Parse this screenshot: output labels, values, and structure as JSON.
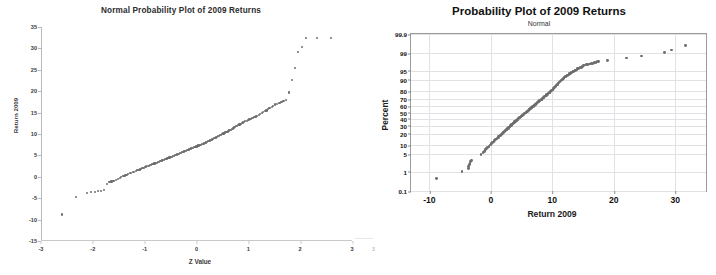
{
  "document": {
    "page_artifact": "3"
  },
  "charts": [
    {
      "id": "normal-probability-plot",
      "title": "Normal Probability Plot of 2009 Returns",
      "subtitle": "",
      "xlabel": "Z Value",
      "ylabel": "Return 2009",
      "marker_color": "#6e6e6e"
    },
    {
      "id": "minitab-probability-plot",
      "title": "Probability Plot of 2009 Returns",
      "subtitle": "Normal",
      "xlabel": "Return 2009",
      "ylabel": "Percent",
      "marker_color": "#6e6e6e"
    }
  ],
  "chart_data": [
    {
      "type": "scatter",
      "title": "Normal Probability Plot of 2009 Returns",
      "subtitle": "",
      "xlabel": "Z Value",
      "ylabel": "Return 2009",
      "xlim": [
        -3,
        3
      ],
      "ylim": [
        -15,
        35
      ],
      "xticks": [
        -3,
        -2,
        -1,
        0,
        1,
        2,
        3
      ],
      "xticklabels": [
        "-3",
        "-2",
        "-1",
        "0",
        "1",
        "2",
        "3"
      ],
      "yticks": [
        -15,
        -10,
        -5,
        0,
        5,
        10,
        15,
        20,
        25,
        30,
        35
      ],
      "yticklabels": [
        "-15",
        "-10",
        "-5",
        "0",
        "5",
        "10",
        "15",
        "20",
        "25",
        "30",
        "35"
      ],
      "grid": false,
      "legend": "none",
      "series": [
        {
          "name": "2009 Returns vs Z",
          "x": [
            -2.6,
            -2.32,
            -2.12,
            -2.04,
            -1.96,
            -1.9,
            -1.84,
            -1.78,
            -1.73,
            -1.68,
            -1.64,
            -1.6,
            -1.56,
            -1.52,
            -1.48,
            -1.45,
            -1.41,
            -1.38,
            -1.35,
            -1.32,
            -1.29,
            -1.26,
            -1.23,
            -1.2,
            -1.17,
            -1.15,
            -1.12,
            -1.09,
            -1.07,
            -1.04,
            -1.02,
            -0.99,
            -0.97,
            -0.94,
            -0.92,
            -0.9,
            -0.87,
            -0.85,
            -0.83,
            -0.81,
            -0.78,
            -0.76,
            -0.74,
            -0.72,
            -0.7,
            -0.68,
            -0.66,
            -0.64,
            -0.62,
            -0.6,
            -0.58,
            -0.56,
            -0.54,
            -0.52,
            -0.5,
            -0.48,
            -0.46,
            -0.44,
            -0.42,
            -0.4,
            -0.38,
            -0.36,
            -0.34,
            -0.32,
            -0.3,
            -0.28,
            -0.26,
            -0.24,
            -0.22,
            -0.2,
            -0.18,
            -0.16,
            -0.14,
            -0.12,
            -0.1,
            -0.08,
            -0.06,
            -0.04,
            -0.02,
            0.0,
            0.02,
            0.04,
            0.06,
            0.08,
            0.1,
            0.12,
            0.14,
            0.16,
            0.18,
            0.2,
            0.22,
            0.24,
            0.26,
            0.28,
            0.3,
            0.32,
            0.34,
            0.36,
            0.38,
            0.4,
            0.42,
            0.44,
            0.46,
            0.48,
            0.5,
            0.52,
            0.54,
            0.56,
            0.58,
            0.6,
            0.62,
            0.64,
            0.66,
            0.68,
            0.7,
            0.72,
            0.74,
            0.76,
            0.78,
            0.81,
            0.83,
            0.85,
            0.87,
            0.9,
            0.92,
            0.94,
            0.97,
            0.99,
            1.02,
            1.04,
            1.07,
            1.09,
            1.12,
            1.15,
            1.17,
            1.2,
            1.23,
            1.26,
            1.29,
            1.32,
            1.35,
            1.38,
            1.41,
            1.45,
            1.48,
            1.52,
            1.56,
            1.6,
            1.64,
            1.68,
            1.73,
            1.78,
            1.84,
            1.9,
            1.96,
            2.04,
            2.12,
            2.32,
            2.6
          ],
          "y": [
            -8.8,
            -4.7,
            -3.7,
            -3.6,
            -3.5,
            -3.4,
            -3.3,
            -3.1,
            -1.6,
            -1.3,
            -1.1,
            -0.9,
            -0.7,
            -0.5,
            -0.3,
            -0.1,
            0.1,
            0.3,
            0.5,
            0.6,
            0.8,
            0.9,
            1.1,
            1.2,
            1.3,
            1.5,
            1.6,
            1.7,
            1.9,
            2.0,
            2.1,
            2.2,
            2.4,
            2.5,
            2.6,
            2.7,
            2.8,
            2.9,
            3.0,
            3.1,
            3.2,
            3.3,
            3.4,
            3.5,
            3.6,
            3.7,
            3.8,
            3.9,
            4.0,
            4.1,
            4.2,
            4.3,
            4.4,
            4.5,
            4.6,
            4.7,
            4.8,
            4.9,
            5.0,
            5.1,
            5.2,
            5.3,
            5.4,
            5.5,
            5.6,
            5.7,
            5.8,
            5.9,
            6.0,
            6.1,
            6.2,
            6.3,
            6.4,
            6.5,
            6.6,
            6.7,
            6.8,
            6.9,
            7.0,
            7.1,
            7.2,
            7.3,
            7.4,
            7.5,
            7.6,
            7.7,
            7.8,
            7.9,
            8.0,
            8.2,
            8.3,
            8.4,
            8.5,
            8.6,
            8.7,
            8.9,
            9.0,
            9.1,
            9.2,
            9.3,
            9.5,
            9.6,
            9.7,
            9.8,
            10.0,
            10.1,
            10.2,
            10.4,
            10.5,
            10.6,
            10.8,
            10.9,
            11.0,
            11.2,
            11.3,
            11.5,
            11.6,
            11.8,
            11.9,
            12.1,
            12.2,
            12.4,
            12.5,
            12.7,
            12.8,
            13.0,
            13.1,
            13.3,
            13.4,
            13.5,
            13.7,
            13.8,
            14.0,
            14.1,
            14.3,
            14.5,
            14.7,
            14.9,
            15.1,
            15.3,
            15.5,
            15.8,
            16.0,
            16.4,
            16.6,
            16.9,
            17.1,
            17.3,
            17.5,
            17.7,
            17.9,
            19.7,
            22.7,
            25.4,
            29.1,
            30.3,
            32.4,
            32.4,
            32.4
          ]
        }
      ]
    },
    {
      "type": "scatter",
      "title": "Probability Plot of 2009 Returns",
      "subtitle": "Normal",
      "xlabel": "Return 2009",
      "ylabel": "Percent",
      "xlim": [
        -13,
        35
      ],
      "ylim_percent": [
        0.1,
        99.9
      ],
      "yscale": "normal-probability",
      "xticks": [
        -10,
        0,
        10,
        20,
        30
      ],
      "xticklabels": [
        "-10",
        "0",
        "10",
        "20",
        "30"
      ],
      "yticks": [
        0.1,
        1,
        5,
        10,
        20,
        30,
        40,
        50,
        60,
        70,
        80,
        90,
        95,
        99,
        99.9
      ],
      "yticklabels": [
        "0.1",
        "1",
        "5",
        "10",
        "20",
        "30",
        "40",
        "50",
        "60",
        "70",
        "80",
        "90",
        "95",
        "99",
        "99.9"
      ],
      "grid": true,
      "legend": "none",
      "series": [
        {
          "name": "2009 Returns percent plot",
          "x": [
            -8.8,
            -4.7,
            -3.7,
            -3.6,
            -3.5,
            -3.4,
            -3.3,
            -3.1,
            -1.6,
            -1.3,
            -1.1,
            -0.9,
            -0.7,
            -0.5,
            -0.3,
            -0.1,
            0.1,
            0.3,
            0.5,
            0.6,
            0.8,
            0.9,
            1.1,
            1.2,
            1.3,
            1.5,
            1.6,
            1.7,
            1.9,
            2.0,
            2.1,
            2.2,
            2.4,
            2.5,
            2.6,
            2.7,
            2.8,
            2.9,
            3.0,
            3.1,
            3.2,
            3.3,
            3.4,
            3.5,
            3.6,
            3.7,
            3.8,
            3.9,
            4.0,
            4.1,
            4.2,
            4.3,
            4.4,
            4.5,
            4.6,
            4.7,
            4.8,
            4.9,
            5.0,
            5.1,
            5.2,
            5.3,
            5.4,
            5.5,
            5.6,
            5.7,
            5.8,
            5.9,
            6.0,
            6.1,
            6.2,
            6.3,
            6.4,
            6.5,
            6.6,
            6.7,
            6.8,
            6.9,
            7.0,
            7.1,
            7.2,
            7.3,
            7.4,
            7.5,
            7.6,
            7.7,
            7.8,
            7.9,
            8.0,
            8.2,
            8.3,
            8.4,
            8.5,
            8.6,
            8.7,
            8.9,
            9.0,
            9.1,
            9.2,
            9.3,
            9.5,
            9.6,
            9.7,
            9.8,
            10.0,
            10.1,
            10.2,
            10.4,
            10.5,
            10.6,
            10.8,
            10.9,
            11.0,
            11.2,
            11.3,
            11.5,
            11.6,
            11.8,
            11.9,
            12.1,
            12.2,
            12.4,
            12.5,
            12.7,
            12.8,
            13.0,
            13.1,
            13.3,
            13.4,
            13.5,
            13.7,
            13.8,
            14.0,
            14.1,
            14.3,
            14.5,
            14.7,
            14.9,
            15.1,
            15.3,
            15.5,
            15.8,
            16.0,
            16.4,
            16.6,
            16.9,
            17.1,
            17.3,
            17.5,
            19.0,
            22.0,
            24.5,
            28.2,
            29.4,
            31.6
          ],
          "percent": [
            0.45,
            1.0,
            1.4,
            1.7,
            2.0,
            2.3,
            2.6,
            2.9,
            5.0,
            5.7,
            6.4,
            7.1,
            7.8,
            8.5,
            9.3,
            10.1,
            10.9,
            11.7,
            12.5,
            13.3,
            14.1,
            14.9,
            15.7,
            16.5,
            17.3,
            18.1,
            18.9,
            19.7,
            20.5,
            21.3,
            22.1,
            22.9,
            23.7,
            24.5,
            25.3,
            26.1,
            26.9,
            27.7,
            28.5,
            29.3,
            30.1,
            30.9,
            31.7,
            32.5,
            33.3,
            34.1,
            34.9,
            35.7,
            36.5,
            37.3,
            38.1,
            38.9,
            39.7,
            40.5,
            41.3,
            42.1,
            42.9,
            43.7,
            44.5,
            45.3,
            46.1,
            46.9,
            47.7,
            48.5,
            49.3,
            50.1,
            50.9,
            51.7,
            52.5,
            53.3,
            54.1,
            54.9,
            55.7,
            56.5,
            57.3,
            58.1,
            58.9,
            59.7,
            60.5,
            61.3,
            62.1,
            62.9,
            63.7,
            64.5,
            65.3,
            66.1,
            66.9,
            67.7,
            68.5,
            69.3,
            70.1,
            70.9,
            71.7,
            72.5,
            73.3,
            74.1,
            74.9,
            75.7,
            76.5,
            77.3,
            78.1,
            78.9,
            79.7,
            80.5,
            81.3,
            82.1,
            82.9,
            83.7,
            84.5,
            85.3,
            86.1,
            86.9,
            87.7,
            88.5,
            89.3,
            89.9,
            90.4,
            90.9,
            91.4,
            91.9,
            92.3,
            92.7,
            93.0,
            93.3,
            93.6,
            93.9,
            94.2,
            94.5,
            94.7,
            94.9,
            95.1,
            95.3,
            95.5,
            95.7,
            95.9,
            96.1,
            96.3,
            96.5,
            96.7,
            96.9,
            97.0,
            97.1,
            97.2,
            97.3,
            97.4,
            97.5,
            97.6,
            97.7,
            97.8,
            98.0,
            98.4,
            98.7,
            99.1,
            99.3,
            99.6
          ]
        }
      ]
    }
  ]
}
